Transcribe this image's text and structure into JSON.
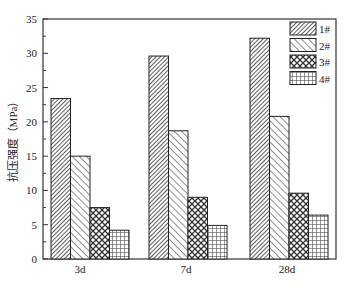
{
  "chart_data": {
    "type": "bar",
    "title": "",
    "xlabel": "",
    "ylabel": "抗压强度（MPa）",
    "ylim": [
      0,
      35
    ],
    "yticks": [
      0,
      5,
      10,
      15,
      20,
      25,
      30,
      35
    ],
    "categories": [
      "3d",
      "7d",
      "28d"
    ],
    "series": [
      {
        "name": "1#",
        "pattern": "dense-diagonal",
        "values": [
          23.4,
          29.6,
          32.2
        ]
      },
      {
        "name": "2#",
        "pattern": "back-diagonal",
        "values": [
          15.0,
          18.7,
          20.8
        ]
      },
      {
        "name": "3#",
        "pattern": "crosshatch-diamond",
        "values": [
          7.5,
          9.0,
          9.6
        ]
      },
      {
        "name": "4#",
        "pattern": "grid",
        "values": [
          4.2,
          4.9,
          6.4
        ]
      }
    ],
    "legend_position": "upper right",
    "grid": false
  }
}
